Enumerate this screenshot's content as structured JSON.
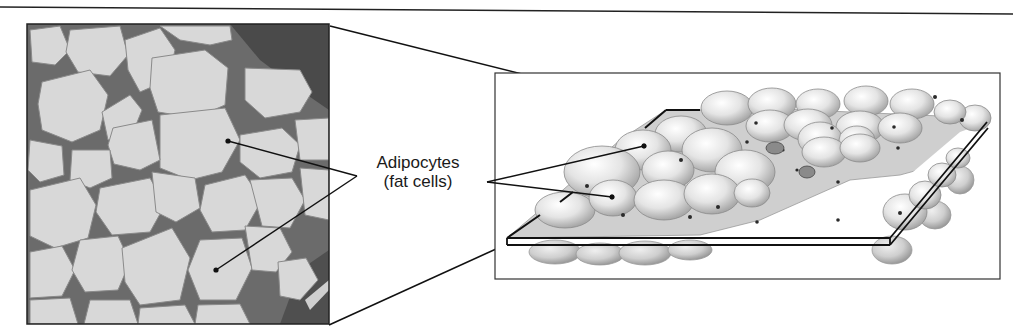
{
  "figure": {
    "colors": {
      "line": "#111111",
      "cell_fill": "#d8d8d8",
      "tissue_gap": "#6b6b6b",
      "tissue_dark": "#4a4a4a",
      "illustration_cell": "#e6e6e6",
      "illustration_matrix": "#c9c9c9",
      "background": "#ffffff"
    },
    "panels": {
      "micrograph": {
        "name": "light-micrograph",
        "x": 27,
        "y": 24,
        "width": 302,
        "height": 300
      },
      "illustration": {
        "name": "adipose-illustration",
        "x": 495,
        "y": 73,
        "width": 505,
        "height": 206
      }
    },
    "label": {
      "line1": "Adipocytes",
      "line2": "(fat cells)"
    }
  }
}
